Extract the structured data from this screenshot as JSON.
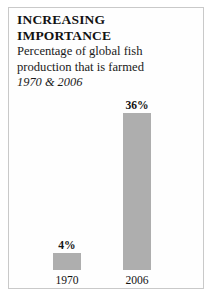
{
  "figure": {
    "headline_line1": "INCREASING",
    "headline_line2": "IMPORTANCE",
    "subtitle_line1": "Percentage of global fish",
    "subtitle_line2": "production that is farmed",
    "daterange": "1970 & 2006",
    "frame_color": "#c9c9c9",
    "background_color": "#ffffff"
  },
  "chart_data": {
    "type": "bar",
    "title": "INCREASING IMPORTANCE",
    "subtitle": "Percentage of global fish production that is farmed",
    "annotation": "1970 & 2006",
    "categories": [
      "1970",
      "2006"
    ],
    "values": [
      4,
      36
    ],
    "value_labels": [
      "4%",
      "36%"
    ],
    "xlabel": "",
    "ylabel": "",
    "ylim": [
      0,
      40
    ],
    "grid": false,
    "legend": false,
    "bar_color": "#aeaeae",
    "bars": [
      {
        "category": "1970",
        "value": 4,
        "value_label": "4%"
      },
      {
        "category": "2006",
        "value": 36,
        "value_label": "36%"
      }
    ]
  }
}
